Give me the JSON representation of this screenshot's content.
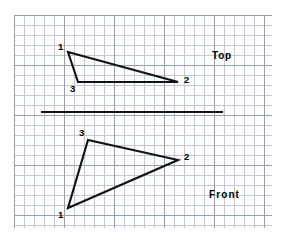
{
  "sheet": {
    "background_color": "#ffffff",
    "grid": {
      "minor_color": "#c3c8d0",
      "major_color": "#9aa0aa",
      "minor_spacing_px": 10,
      "major_every": 5,
      "left_px": 14,
      "top_px": 15,
      "width_px": 258,
      "height_px": 213
    }
  },
  "drawing": {
    "type": "orthographic-projection",
    "line_color": "#111111",
    "line_width_px": 2.1,
    "views": [
      {
        "id": "top",
        "label": "Top",
        "label_x": 212,
        "label_y": 50,
        "shape": "triangle",
        "vertices": [
          {
            "id": "1",
            "x": 68,
            "y": 52,
            "label": "1",
            "label_x": 58,
            "label_y": 42
          },
          {
            "id": "2",
            "x": 178,
            "y": 82,
            "label": "2",
            "label_x": 184,
            "label_y": 75
          },
          {
            "id": "3",
            "x": 78,
            "y": 82,
            "label": "3",
            "label_x": 70,
            "label_y": 84
          }
        ]
      },
      {
        "id": "front",
        "label": "Front",
        "label_x": 209,
        "label_y": 189,
        "shape": "triangle",
        "vertices": [
          {
            "id": "1",
            "x": 68,
            "y": 208,
            "label": "1",
            "label_x": 58,
            "label_y": 210
          },
          {
            "id": "2",
            "x": 178,
            "y": 160,
            "label": "2",
            "label_x": 184,
            "label_y": 152
          },
          {
            "id": "3",
            "x": 88,
            "y": 140,
            "label": "3",
            "label_x": 79,
            "label_y": 128
          }
        ]
      }
    ],
    "fold_line": {
      "name": "reference-fold-line",
      "x1": 42,
      "y1": 112,
      "x2": 222,
      "y2": 112
    }
  }
}
